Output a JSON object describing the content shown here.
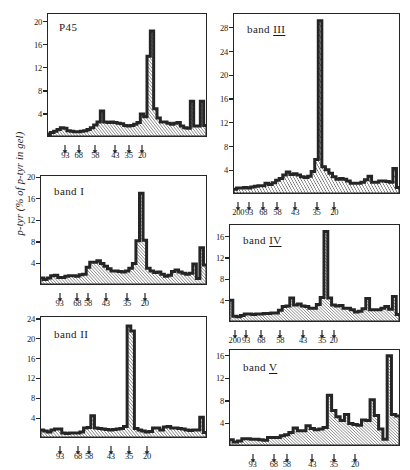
{
  "figure": {
    "ylabel": "p-tyr (% of p-tyr in gel)",
    "hatch_color": "#222222",
    "axis_color": "#252525"
  },
  "chart_data": [
    {
      "type": "bar",
      "title": "P45",
      "panel": "p45",
      "xlabel": "",
      "ylabel": "p-tyr (% of p-tyr in gel)",
      "ylim": [
        0,
        21.5
      ],
      "yticks": [
        4,
        8,
        12,
        16,
        20
      ],
      "grid": false,
      "legend": "none",
      "mw_ticks": [
        {
          "label": "93",
          "slice": 5
        },
        {
          "label": "68",
          "slice": 9
        },
        {
          "label": "58",
          "slice": 14
        },
        {
          "label": "43",
          "slice": 20
        },
        {
          "label": "35",
          "slice": 24
        },
        {
          "label": "20",
          "slice": 28
        }
      ],
      "values": [
        0.5,
        0.8,
        1.0,
        1.3,
        1.6,
        1.5,
        1.1,
        1.0,
        0.9,
        0.9,
        1.0,
        1.1,
        1.3,
        1.6,
        2.1,
        2.6,
        4.5,
        2.6,
        2.5,
        2.6,
        2.5,
        2.4,
        2.3,
        2.0,
        1.9,
        2.0,
        2.2,
        2.5,
        4.0,
        3.5,
        14.0,
        18.4,
        4.9,
        3.3,
        2.6,
        2.6,
        2.4,
        2.2,
        2.4,
        2.5,
        1.9,
        1.6,
        1.5,
        6.2,
        1.9,
        1.9,
        6.2,
        2.0
      ]
    },
    {
      "type": "bar",
      "title": "band I",
      "panel": "band-i",
      "xlabel": "",
      "ylabel": "p-tyr (% of p-tyr in gel)",
      "ylim": [
        0,
        20.4
      ],
      "yticks": [
        4,
        8,
        12,
        16,
        20
      ],
      "grid": false,
      "legend": "none",
      "mw_ticks": [
        {
          "label": "93",
          "slice": 5
        },
        {
          "label": "68",
          "slice": 10
        },
        {
          "label": "58",
          "slice": 13
        },
        {
          "label": "43",
          "slice": 18
        },
        {
          "label": "35",
          "slice": 24
        },
        {
          "label": "20",
          "slice": 29
        }
      ],
      "values": [
        1.3,
        1.0,
        1.3,
        1.7,
        1.8,
        1.4,
        1.4,
        1.6,
        1.7,
        1.7,
        1.6,
        1.9,
        2.0,
        3.3,
        4.2,
        4.2,
        4.5,
        4.0,
        3.5,
        3.0,
        2.6,
        2.6,
        2.5,
        2.4,
        2.6,
        3.1,
        4.0,
        8.2,
        17.0,
        8.3,
        3.1,
        2.6,
        2.3,
        2.4,
        2.0,
        1.6,
        1.8,
        2.5,
        2.8,
        2.4,
        2.2,
        2.0,
        2.2,
        3.9,
        1.2,
        6.9,
        3.7
      ]
    },
    {
      "type": "bar",
      "title": "band II",
      "panel": "band-ii",
      "xlabel": "",
      "ylabel": "p-tyr (% of p-tyr in gel)",
      "ylim": [
        0,
        24.6
      ],
      "yticks": [
        4,
        8,
        12,
        16,
        20,
        24
      ],
      "grid": false,
      "legend": "none",
      "mw_ticks": [
        {
          "label": "93",
          "slice": 5
        },
        {
          "label": "68",
          "slice": 10
        },
        {
          "label": "58",
          "slice": 13
        },
        {
          "label": "43",
          "slice": 19
        },
        {
          "label": "35",
          "slice": 24
        },
        {
          "label": "20",
          "slice": 29
        }
      ],
      "values": [
        1.6,
        1.4,
        1.2,
        1.6,
        1.8,
        1.8,
        1.0,
        0.9,
        1.0,
        1.0,
        1.0,
        1.2,
        2.0,
        2.1,
        4.5,
        2.0,
        1.9,
        1.8,
        1.7,
        1.6,
        1.7,
        1.8,
        1.9,
        2.3,
        22.6,
        21.6,
        1.9,
        1.6,
        1.4,
        1.2,
        1.3,
        2.0,
        2.0,
        1.6,
        2.2,
        2.3,
        2.0,
        2.0,
        1.9,
        1.8,
        1.6,
        1.5,
        1.6,
        1.6,
        4.2,
        1.1
      ]
    },
    {
      "type": "bar",
      "title": "band III",
      "panel": "band-iii",
      "xlabel": "",
      "ylabel": "p-tyr (% of p-tyr in gel)",
      "ylim": [
        0,
        30.5
      ],
      "yticks": [
        4,
        8,
        12,
        16,
        20,
        24,
        28
      ],
      "grid": false,
      "legend": "none",
      "mw_ticks": [
        {
          "label": "200",
          "slice": 1
        },
        {
          "label": "93",
          "slice": 4
        },
        {
          "label": "68",
          "slice": 8
        },
        {
          "label": "58",
          "slice": 12
        },
        {
          "label": "43",
          "slice": 17
        },
        {
          "label": "35",
          "slice": 23
        },
        {
          "label": "20",
          "slice": 28
        }
      ],
      "values": [
        0.8,
        1.0,
        1.0,
        1.1,
        1.0,
        1.2,
        1.3,
        1.4,
        1.4,
        1.8,
        1.6,
        1.9,
        2.3,
        2.6,
        3.2,
        3.7,
        3.3,
        3.4,
        3.2,
        2.9,
        2.8,
        3.0,
        3.8,
        5.8,
        29.2,
        4.6,
        4.1,
        3.5,
        2.9,
        2.5,
        2.6,
        2.5,
        2.2,
        1.8,
        1.8,
        1.8,
        2.0,
        2.4,
        3.0,
        2.0,
        2.0,
        2.2,
        2.2,
        2.1,
        2.0,
        4.3,
        1.1
      ]
    },
    {
      "type": "bar",
      "title": "band IV",
      "panel": "band-iv",
      "xlabel": "",
      "ylabel": "p-tyr (% of p-tyr in gel)",
      "ylim": [
        0,
        18.4
      ],
      "yticks": [
        4,
        8,
        12,
        16
      ],
      "grid": false,
      "legend": "none",
      "mw_ticks": [
        {
          "label": "200",
          "slice": 1
        },
        {
          "label": "93",
          "slice": 4
        },
        {
          "label": "68",
          "slice": 8
        },
        {
          "label": "58",
          "slice": 13
        },
        {
          "label": "43",
          "slice": 19
        },
        {
          "label": "35",
          "slice": 24
        },
        {
          "label": "20",
          "slice": 27
        }
      ],
      "values": [
        4.1,
        1.1,
        1.0,
        1.2,
        1.5,
        1.5,
        1.4,
        1.5,
        1.5,
        1.6,
        1.6,
        1.7,
        1.7,
        2.2,
        2.9,
        3.0,
        4.5,
        3.2,
        3.4,
        3.0,
        2.9,
        2.6,
        2.6,
        3.3,
        4.6,
        17.0,
        4.5,
        3.2,
        3.0,
        3.1,
        2.6,
        2.6,
        2.3,
        1.9,
        2.0,
        2.5,
        4.4,
        2.3,
        2.3,
        2.3,
        2.6,
        2.9,
        2.4,
        4.8,
        1.4
      ]
    },
    {
      "type": "bar",
      "title": "band V",
      "panel": "band-v",
      "xlabel": "",
      "ylabel": "p-tyr (% of p-tyr in gel)",
      "ylim": [
        0,
        17.2
      ],
      "yticks": [
        4,
        8,
        12,
        16
      ],
      "grid": false,
      "legend": "none",
      "mw_ticks": [
        {
          "label": "93",
          "slice": 5
        },
        {
          "label": "68",
          "slice": 10
        },
        {
          "label": "58",
          "slice": 13
        },
        {
          "label": "43",
          "slice": 19
        },
        {
          "label": "35",
          "slice": 24
        },
        {
          "label": "20",
          "slice": 29
        }
      ],
      "values": [
        1.1,
        0.7,
        0.9,
        1.3,
        1.3,
        1.2,
        1.2,
        1.1,
        1.0,
        1.5,
        1.5,
        1.5,
        1.8,
        2.0,
        2.4,
        3.2,
        2.7,
        2.7,
        3.6,
        3.1,
        2.9,
        3.0,
        3.3,
        9.0,
        6.3,
        5.2,
        4.5,
        5.6,
        4.0,
        3.8,
        3.7,
        4.6,
        4.5,
        8.2,
        5.4,
        3.0,
        1.2,
        16.0,
        5.6,
        5.3
      ]
    }
  ]
}
